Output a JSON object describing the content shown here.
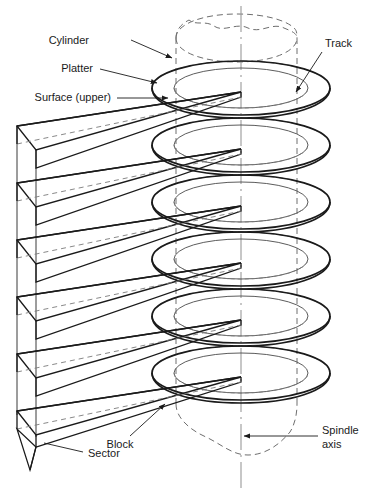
{
  "figure": {
    "kind": "hard-disk-drive-structure-diagram",
    "background_color": "#ffffff",
    "line_color": "#1a1a1a",
    "dashed_color": "#6e6e6e",
    "axis_color": "#8a8a8a",
    "platter_count": 6,
    "arm_count": 6
  },
  "labels": {
    "cylinder": "Cylinder",
    "platter": "Platter",
    "surface_upper": "Surface (upper)",
    "track": "Track",
    "block": "Block",
    "sector": "Sector",
    "spindle_axis_line1": "Spindle",
    "spindle_axis_line2": "axis"
  }
}
